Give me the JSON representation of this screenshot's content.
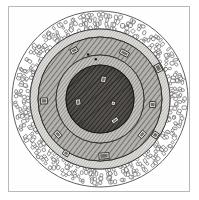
{
  "plate": {
    "title": "Circular fortified enclosure plan",
    "kind": "antique-engraving",
    "frame": {
      "visible": true,
      "stroke": "#b9b9b9",
      "fill": "#fefefe"
    },
    "background": "#ffffff"
  },
  "diagram": {
    "type": "concentric-plan",
    "center": {
      "cx": 100,
      "cy": 99
    },
    "rings": [
      {
        "name": "outer-rubble-belt",
        "label": "Outer stone rubble rampart",
        "r_outer": 88,
        "r_inner": 70,
        "fill": "#ffffff",
        "stroke": "#3a3a3a",
        "texture": "cobblestone"
      },
      {
        "name": "outer-ditch-band",
        "label": "Outer smooth berm",
        "r_outer": 70,
        "r_inner": 62,
        "fill": "#d8d6d2",
        "stroke": "#2f2f2f",
        "texture": "plain"
      },
      {
        "name": "hatched-rampart-ring",
        "label": "Hatched earthen rampart",
        "r_outer": 62,
        "r_inner": 44,
        "fill": "#a9a7a2",
        "stroke": "#2a2a2a",
        "texture": "diagonal-hatch"
      },
      {
        "name": "inner-terrace-ring",
        "label": "Inner terrace walk",
        "r_outer": 44,
        "r_inner": 34,
        "fill": "#bcbab5",
        "stroke": "#2a2a2a",
        "texture": "fine-hatch"
      },
      {
        "name": "central-court",
        "label": "Central court",
        "r_outer": 34,
        "r_inner": 0,
        "fill": "#4a4743",
        "stroke": "#1d1b19",
        "texture": "dense-shading"
      }
    ],
    "markers": [
      {
        "name": "gate-marker-n",
        "label": "N gate",
        "angle_deg": -62,
        "radius": 52,
        "w": 9,
        "h": 5
      },
      {
        "name": "gate-marker-ne",
        "label": "NE gate",
        "angle_deg": -28,
        "radius": 66,
        "w": 8,
        "h": 6
      },
      {
        "name": "gate-marker-nw",
        "label": "NW gate",
        "angle_deg": -118,
        "radius": 55,
        "w": 7,
        "h": 5
      },
      {
        "name": "gate-marker-w",
        "label": "W gate",
        "angle_deg": 178,
        "radius": 56,
        "w": 6,
        "h": 7
      },
      {
        "name": "gate-marker-e",
        "label": "E gate",
        "angle_deg": 6,
        "radius": 53,
        "w": 6,
        "h": 6
      },
      {
        "name": "gate-marker-se",
        "label": "SE gate",
        "angle_deg": 40,
        "radius": 55,
        "w": 7,
        "h": 5
      },
      {
        "name": "gate-marker-sse",
        "label": "SSE gate",
        "angle_deg": 33,
        "radius": 66,
        "w": 6,
        "h": 6
      },
      {
        "name": "gate-marker-sw",
        "label": "SW gate",
        "angle_deg": 140,
        "radius": 55,
        "w": 7,
        "h": 5
      },
      {
        "name": "gate-marker-ssw",
        "label": "SSW gate",
        "angle_deg": 122,
        "radius": 64,
        "w": 6,
        "h": 5
      },
      {
        "name": "gate-marker-s",
        "label": "S gate",
        "angle_deg": 86,
        "radius": 57,
        "w": 10,
        "h": 6
      },
      {
        "name": "court-marker-a",
        "label": "court feature A",
        "angle_deg": -80,
        "radius": 20,
        "w": 5,
        "h": 6
      },
      {
        "name": "court-marker-b",
        "label": "court feature B",
        "angle_deg": 172,
        "radius": 22,
        "w": 6,
        "h": 5
      },
      {
        "name": "court-marker-c",
        "label": "court feature C",
        "angle_deg": 55,
        "radius": 26,
        "w": 7,
        "h": 4
      },
      {
        "name": "court-marker-d",
        "label": "court feature D",
        "angle_deg": 18,
        "radius": 14,
        "w": 4,
        "h": 4
      }
    ],
    "dot_markers": [
      {
        "name": "survey-dot-1",
        "angle_deg": -105,
        "radius": 46
      },
      {
        "name": "survey-dot-2",
        "angle_deg": -96,
        "radius": 40
      }
    ]
  }
}
